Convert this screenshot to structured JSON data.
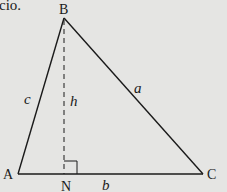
{
  "text_fragment": "cio.",
  "colors": {
    "background": "#e5e5e3",
    "stroke": "#1a1a1a"
  },
  "diagram": {
    "type": "triangle-with-altitude",
    "vertices": [
      {
        "name": "B",
        "x": 64,
        "y": 18
      },
      {
        "name": "A",
        "x": 18,
        "y": 174
      },
      {
        "name": "C",
        "x": 203,
        "y": 174
      }
    ],
    "foot": {
      "name": "N",
      "x": 64,
      "y": 174
    },
    "vertex_labels": {
      "A": "A",
      "B": "B",
      "C": "C",
      "N": "N"
    },
    "side_labels": {
      "a": "a",
      "b": "b",
      "c": "c",
      "h": "h"
    },
    "altitude_style": "dashed",
    "right_angle_marker": true
  }
}
